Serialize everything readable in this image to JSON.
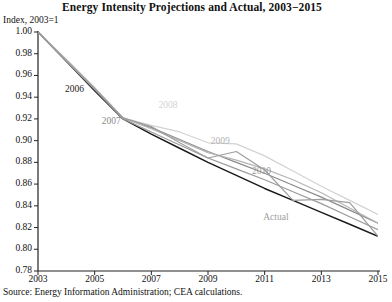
{
  "chart_data": {
    "type": "line",
    "title": "Energy Intensity Projections and Actual, 2003−2015",
    "ylabel": "Index, 2003=1",
    "xlabel": "",
    "source": "Source: Energy Information Administration; CEA calculations.",
    "xlim": [
      2003,
      2015
    ],
    "ylim": [
      0.78,
      1.0
    ],
    "grid": false,
    "legend": "inline-labels",
    "yticks": [
      "1.00",
      "0.98",
      "0.96",
      "0.94",
      "0.92",
      "0.90",
      "0.88",
      "0.86",
      "0.84",
      "0.82",
      "0.80",
      "0.78"
    ],
    "ytick_values": [
      1.0,
      0.98,
      0.96,
      0.94,
      0.92,
      0.9,
      0.88,
      0.86,
      0.84,
      0.82,
      0.8,
      0.78
    ],
    "xticks": [
      "2003",
      "2005",
      "2007",
      "2009",
      "2011",
      "2013",
      "2015"
    ],
    "xtick_values": [
      2003,
      2005,
      2007,
      2009,
      2011,
      2013,
      2015
    ],
    "x": [
      2003,
      2004,
      2005,
      2006,
      2007,
      2008,
      2009,
      2010,
      2011,
      2012,
      2013,
      2014,
      2015
    ],
    "series": [
      {
        "name": "2006",
        "label": "2006",
        "color": "#1a1a1a",
        "width": 1.5,
        "label_x": 2003.95,
        "label_y": 0.947,
        "values": [
          1.0,
          0.973,
          0.946,
          0.92,
          0.906,
          0.893,
          0.88,
          0.868,
          0.856,
          0.845,
          0.834,
          0.823,
          0.812
        ]
      },
      {
        "name": "2007",
        "label": "2007",
        "color": "#8a8a8a",
        "width": 1.2,
        "label_x": 2005.25,
        "label_y": 0.917,
        "values": [
          1.0,
          0.974,
          0.948,
          0.921,
          0.912,
          0.901,
          0.89,
          0.88,
          0.87,
          0.859,
          0.848,
          0.836,
          0.824
        ]
      },
      {
        "name": "2008",
        "label": "2008",
        "color": "#d2d2d2",
        "width": 1.2,
        "label_x": 2007.25,
        "label_y": 0.932,
        "values": [
          1.0,
          0.975,
          0.949,
          0.921,
          0.914,
          0.908,
          0.898,
          0.897,
          0.886,
          0.872,
          0.858,
          0.845,
          0.832
        ]
      },
      {
        "name": "2009",
        "label": "2009",
        "color": "#b5b5b5",
        "width": 1.2,
        "label_x": 2009.1,
        "label_y": 0.899,
        "values": [
          1.0,
          0.974,
          0.948,
          0.921,
          0.911,
          0.9,
          0.889,
          0.882,
          0.874,
          0.864,
          0.852,
          0.838,
          0.824
        ]
      },
      {
        "name": "2010",
        "label": "2010",
        "color": "#9a9a9a",
        "width": 1.2,
        "label_x": 2010.55,
        "label_y": 0.871,
        "values": [
          1.0,
          0.973,
          0.947,
          0.92,
          0.908,
          0.896,
          0.884,
          0.874,
          0.864,
          0.853,
          0.842,
          0.83,
          0.818
        ]
      },
      {
        "name": "Actual",
        "label": "Actual",
        "color": "#9e9e9e",
        "width": 1.2,
        "label_x": 2010.95,
        "label_y": 0.829,
        "values": [
          1.0,
          0.974,
          0.948,
          0.921,
          0.913,
          0.898,
          0.884,
          0.89,
          0.873,
          0.845,
          0.846,
          0.843,
          0.812
        ]
      }
    ]
  }
}
